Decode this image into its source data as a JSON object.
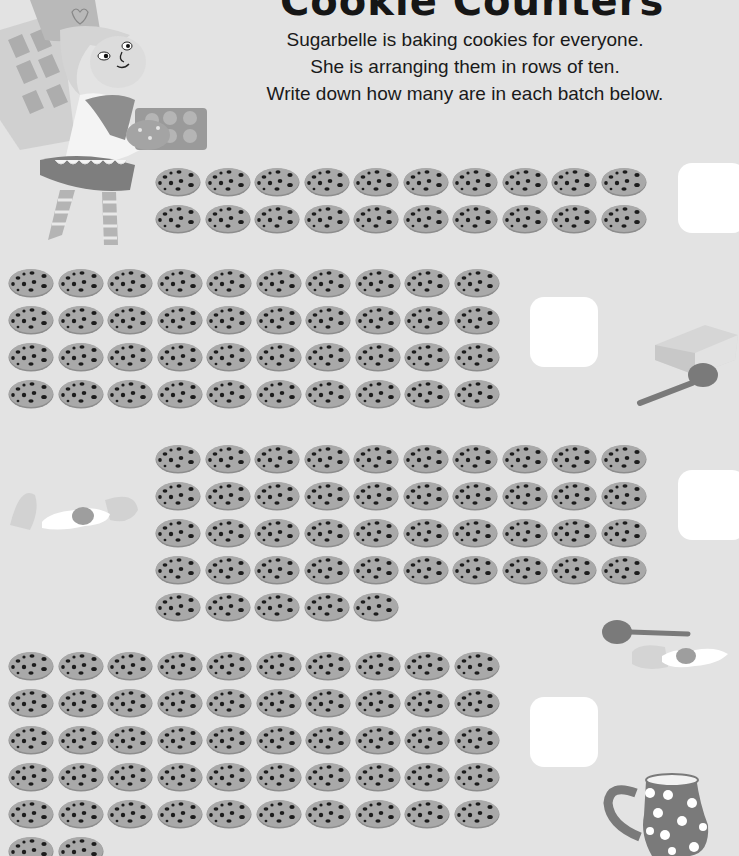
{
  "worksheet": {
    "title": "Cookie Counters",
    "instructions": [
      "Sugarbelle is baking cookies for everyone.",
      "She is arranging them in rows of ten.",
      "Write down how many are in each batch below."
    ]
  },
  "batches": [
    {
      "id": 1,
      "rows_of_ten": 2,
      "extra": 0,
      "total": 20,
      "answer": ""
    },
    {
      "id": 2,
      "rows_of_ten": 4,
      "extra": 0,
      "total": 40,
      "answer": ""
    },
    {
      "id": 3,
      "rows_of_ten": 4,
      "extra": 5,
      "total": 45,
      "answer": ""
    },
    {
      "id": 4,
      "rows_of_ten": 5,
      "extra": 2,
      "total": 52,
      "answer": ""
    }
  ],
  "illustrations": [
    "fairy-baker-sugarbelle",
    "butter-block",
    "spoon",
    "cracked-egg",
    "spoon",
    "cracked-egg",
    "polka-dot-jug"
  ],
  "colors": {
    "background": "#e3e3e3",
    "cookie": "#a9a9a9",
    "cookie_edge": "#8d8d8d",
    "chip": "#1c1c1c",
    "answer_box": "#ffffff"
  }
}
